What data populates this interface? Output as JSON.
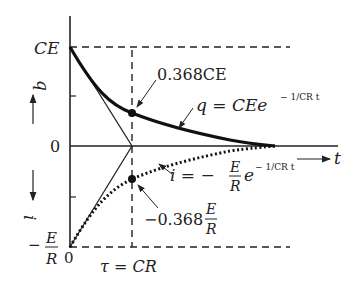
{
  "diagram": {
    "labels": {
      "ce_axis": "CE",
      "zero_axis": "0",
      "neg_e_num": "E",
      "neg_e_den": "R",
      "neg_sign": "−",
      "origin_zero": "0",
      "q_axis": "q",
      "i_axis": "i",
      "t_axis": "t",
      "tau": "τ = CR",
      "point_q": "0.368CE",
      "point_i_prefix": "−0.368",
      "point_i_num": "E",
      "point_i_den": "R",
      "q_eq": "q = CEe",
      "q_exp": "− 1/CR t",
      "i_eq_prefix": "i = −",
      "i_eq_num": "E",
      "i_eq_den": "R",
      "i_eq_e": "e",
      "i_exp": "− 1/CR t"
    },
    "colors": {
      "ink": "#222222",
      "background": "#ffffff"
    }
  }
}
